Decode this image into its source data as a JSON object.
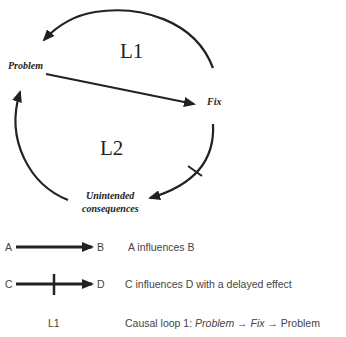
{
  "diagram": {
    "nodes": {
      "problem": "Problem",
      "fix": "Fix",
      "unintended_1": "Unintended",
      "unintended_2": "consequences"
    },
    "loops": {
      "l1": "L1",
      "l2": "L2"
    }
  },
  "legend": {
    "row1": {
      "from": "A",
      "to": "B",
      "desc": "A influences B"
    },
    "row2": {
      "from": "C",
      "to": "D",
      "desc": "C influences D with a delayed effect"
    },
    "row3": {
      "label": "L1",
      "desc_prefix": "Causal loop 1: ",
      "desc_problem": "Problem",
      "arrow1": " → ",
      "desc_fix": "Fix",
      "arrow2": " → ",
      "desc_end": "Problem"
    }
  },
  "colors": {
    "ink": "#222222",
    "legend_text": "#444444"
  }
}
